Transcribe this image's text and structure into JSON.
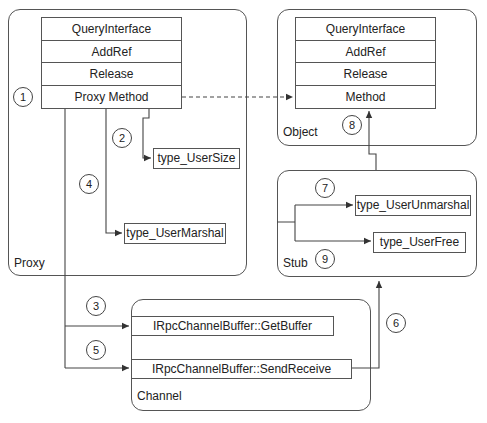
{
  "diagram": {
    "proxy": {
      "label": "Proxy",
      "vtable": [
        "QueryInterface",
        "AddRef",
        "Release",
        "Proxy Method"
      ],
      "helpers": {
        "user_size": "type_UserSize",
        "user_marshal": "type_UserMarshal"
      }
    },
    "object": {
      "label": "Object",
      "vtable": [
        "QueryInterface",
        "AddRef",
        "Release",
        "Method"
      ]
    },
    "stub": {
      "label": "Stub",
      "helpers": {
        "user_unmarshal": "type_UserUnmarshal",
        "user_free": "type_UserFree"
      }
    },
    "channel": {
      "label": "Channel",
      "methods": {
        "get_buffer": "IRpcChannelBuffer::GetBuffer",
        "send_receive": "IRpcChannelBuffer::SendReceive"
      }
    },
    "steps": [
      "1",
      "2",
      "3",
      "4",
      "5",
      "6",
      "7",
      "8",
      "9"
    ],
    "colors": {
      "line": "#444444",
      "border": "#555555",
      "background": "#ffffff"
    }
  }
}
